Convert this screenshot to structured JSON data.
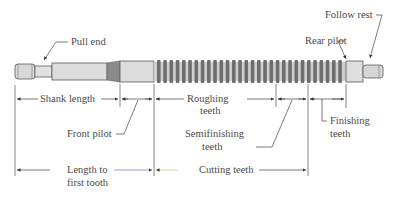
{
  "diagram": {
    "labels": {
      "pull_end": "Pull end",
      "follow_rest": "Follow rest",
      "rear_pilot": "Rear pilot",
      "shank_length": "Shank length",
      "roughing_teeth_1": "Roughing",
      "roughing_teeth_2": "teeth",
      "front_pilot": "Front pilot",
      "semifinishing_teeth_1": "Semifinishing",
      "semifinishing_teeth_2": "teeth",
      "finishing_teeth_1": "Finishing",
      "finishing_teeth_2": "teeth",
      "length_to_first_tooth_1": "Length to",
      "length_to_first_tooth_2": "first tooth",
      "cutting_teeth": "Cutting teeth"
    },
    "colors": {
      "body_fill": "#d9d9d9",
      "tooth_fill": "#6e6e6e",
      "taper_fill": "#8a8a8a",
      "outline": "#5a5a5a",
      "dimension_line": "#444444",
      "length_line_accent": "#7070c8",
      "cutting_line_accent": "#c8c070"
    }
  }
}
